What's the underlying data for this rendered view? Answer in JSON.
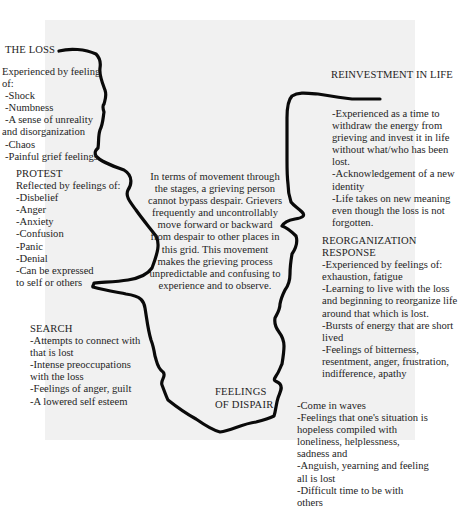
{
  "diagram": {
    "type": "grief-stages-path",
    "background_color": "#f1f1f1",
    "line_color": "#0a0a0a"
  },
  "stages": {
    "loss": {
      "title": "THE LOSS",
      "lines": [
        "Experienced by feeling",
        "of:",
        "-Shock",
        "-Numbness",
        "-A sense of unreality",
        "and disorganization",
        "-Chaos",
        "-Painful grief feelings"
      ]
    },
    "protest": {
      "title": "PROTEST",
      "lines": [
        "Reflected by feelings of:",
        "-Disbelief",
        "-Anger",
        "-Anxiety",
        "-Confusion",
        "-Panic",
        "-Denial",
        "-Can be expressed",
        "to self or others"
      ]
    },
    "search": {
      "title": "SEARCH",
      "lines": [
        "-Attempts to connect with",
        "that is lost",
        "-Intense preoccupations",
        "with the loss",
        "-Feelings of anger, guilt",
        "-A lowered self esteem"
      ]
    },
    "dispair": {
      "title_lines": [
        "FEELINGS",
        "OF DISPAIR"
      ],
      "lines": [
        "-Come in waves",
        "-Feelings that one's situation is",
        "hopeless compiled with",
        "loneliness, helplessness,",
        "sadness and",
        "-Anguish, yearning and feeling",
        "all is lost",
        "-Difficult time to be with",
        "others"
      ]
    },
    "reorganization": {
      "title_lines": [
        "REORGANIZATION",
        "RESPONSE"
      ],
      "lines": [
        "-Experienced by feelings of:",
        "exhaustion, fatigue",
        "-Learning to live with the loss",
        "and beginning to reorganize life",
        "around that which is lost.",
        "-Bursts of energy that are short",
        "lived",
        "-Feelings of bitterness,",
        "resentment, anger, frustration,",
        "indifference, apathy"
      ]
    },
    "reinvestment": {
      "title": "REINVESTMENT IN LIFE",
      "lines": [
        "-Experienced as a time to",
        "withdraw the energy from",
        "grieving and invest it in life",
        "without what/who has been",
        "lost.",
        "-Acknowledgement of a new",
        "identity",
        "-Life takes on new meaning",
        "even though the loss is not",
        "forgotten."
      ]
    }
  },
  "center_note": {
    "lines": [
      "In terms of movement through",
      "the stages, a grieving person",
      "cannot bypass despair. Grievers",
      "frequently and uncontrollably",
      "move forward or backward",
      "from despair to other places in",
      "this grid.  This movement",
      "makes the grieving process",
      "unpredictable and confusing to",
      "experience and to observe."
    ]
  }
}
